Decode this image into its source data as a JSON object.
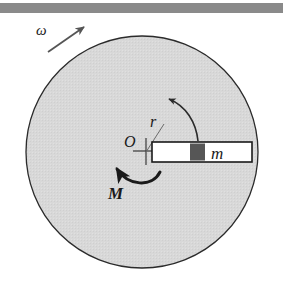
{
  "figure": {
    "domain": "Diagram",
    "width": 283,
    "height": 282,
    "background_color": "#ffffff"
  },
  "top_bar": {
    "name": "page-edge-bar",
    "color": "#8a8a8a",
    "x": 0,
    "y": 3,
    "width": 283,
    "height": 10
  },
  "disk": {
    "label": "rotating disk",
    "fill_color": "#d8d8d8",
    "stroke_color": "#2b2b2b",
    "center_x": 142,
    "center_y": 152,
    "radius": 116
  },
  "center_marker": {
    "label": "O",
    "x": 146,
    "y": 151,
    "arm": 10
  },
  "labels": {
    "omega": "ω",
    "radius": "r",
    "origin": "O",
    "mass": "m",
    "moment": "M"
  },
  "omega_arrow": {
    "name": "angular-velocity-arrow",
    "label": "ω",
    "from_x": 48,
    "from_y": 52,
    "to_x": 85,
    "to_y": 26,
    "label_x": 38,
    "label_y": 34,
    "color": "#555555"
  },
  "radius_arc": {
    "name": "radius-arc-arrow",
    "label": "r",
    "start_x": 198,
    "start_y": 141,
    "end_x": 168,
    "end_y": 100,
    "label_x": 155,
    "label_y": 126,
    "color": "#2b2b2b"
  },
  "moment_arc": {
    "name": "moment-arc-arrow",
    "label": "M",
    "start_x": 158,
    "start_y": 176,
    "end_x": 118,
    "end_y": 168,
    "label_x": 117,
    "label_y": 197,
    "color": "#1a1a1a"
  },
  "rod": {
    "name": "guide-rod",
    "x": 152,
    "y": 142,
    "width": 100,
    "height": 20,
    "fill_color": "#ffffff",
    "stroke_color": "#1a1a1a"
  },
  "mass_block": {
    "name": "sliding-mass-block",
    "label": "m",
    "x": 190,
    "y": 143,
    "width": 15,
    "height": 18,
    "fill_color": "#565656",
    "label_x": 214,
    "label_y": 158
  }
}
